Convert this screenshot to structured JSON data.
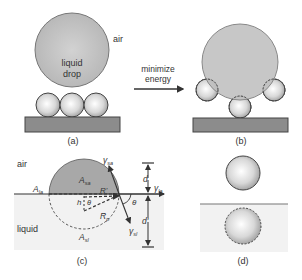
{
  "panels": {
    "a": {
      "label": "(a)",
      "air_label": "air",
      "drop_label_line1": "liquid",
      "drop_label_line2": "drop"
    },
    "arrow": {
      "line1": "minimize",
      "line2": "energy"
    },
    "b": {
      "label": "(b)"
    },
    "c": {
      "label": "(c)",
      "air_label": "air",
      "liquid_label": "liquid",
      "A_la": "A",
      "A_la_sub": "la",
      "A_sa": "A",
      "A_sa_sub": "sa",
      "A_sl": "A",
      "A_sl_sub": "sl",
      "R_prime": "R'",
      "R_p": "R",
      "R_p_sub": "p",
      "h": "h",
      "theta_inner": "θ",
      "theta_outer": "θ",
      "gamma_sa": "γ",
      "gamma_sa_sub": "sa",
      "gamma_la": "γ",
      "gamma_la_sub": "la",
      "gamma_sl": "γ",
      "gamma_sl_sub": "sl",
      "d": "d",
      "d_prime": "d'"
    },
    "d": {
      "label": "(d)"
    }
  },
  "colors": {
    "drop_fill": "#bdbdbd",
    "cap_fill": "#a8a8a8",
    "substrate": "#8c8c8c",
    "liquid_bg": "#f2f2f2",
    "line": "#333333"
  }
}
